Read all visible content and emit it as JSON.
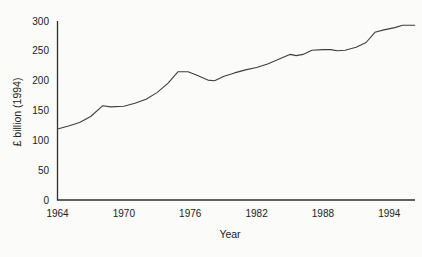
{
  "figure": {
    "background_color": "#fbfbf9",
    "axis_color": "#2e2e2e",
    "text_color": "#222222"
  },
  "chart_data": {
    "type": "line",
    "title": "",
    "xlabel": "Year",
    "ylabel": "£ billion (1994)",
    "x_ticks": [
      1964,
      1970,
      1976,
      1982,
      1988,
      1994
    ],
    "y_ticks": [
      0,
      50,
      100,
      150,
      200,
      250,
      300
    ],
    "xlim": [
      1964,
      1996.5
    ],
    "ylim": [
      0,
      300
    ],
    "grid": false,
    "legend": false,
    "line_color": "#3f3f3f",
    "series": [
      {
        "name": "real-value-series",
        "x": [
          1964,
          1965,
          1966,
          1967,
          1968.1,
          1968.8,
          1970,
          1971,
          1972,
          1973,
          1974,
          1974.9,
          1975.8,
          1976.5,
          1977.6,
          1978.2,
          1979,
          1980,
          1981,
          1982,
          1983,
          1984,
          1985,
          1985.6,
          1986.2,
          1987,
          1988,
          1988.7,
          1989.3,
          1990,
          1991,
          1991.9,
          1992.7,
          1993.5,
          1994.5,
          1995.2,
          1996.3
        ],
        "y": [
          119,
          124,
          130,
          140,
          158,
          156,
          157,
          162,
          169,
          180,
          196,
          215,
          215,
          210,
          201,
          200,
          207,
          213,
          218,
          222,
          228,
          236,
          244,
          242,
          244,
          251,
          252,
          252,
          250,
          251,
          256,
          264,
          281,
          285,
          289,
          293,
          293
        ]
      }
    ]
  }
}
